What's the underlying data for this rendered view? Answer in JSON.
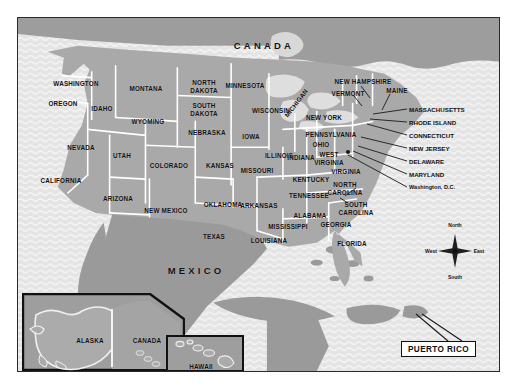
{
  "figure": {
    "kind": "reference-map",
    "title_visible": false,
    "frame": {
      "border_color": "#2b2b2b"
    }
  },
  "palette": {
    "land_us": "#a9a9a9",
    "land_foreign": "#9a9a9a",
    "ocean": "#e4e4e4",
    "ocean_wave": "#f4f4f4",
    "border_state": "#ffffff",
    "border_frame": "#2b2b2b",
    "label_text": "#111111",
    "tag_background": "#ffffff"
  },
  "countries": [
    {
      "name": "CANADA",
      "x": 246,
      "y": 27
    },
    {
      "name": "MEXICO",
      "x": 178,
      "y": 252
    }
  ],
  "states": [
    {
      "name": "WASHINGTON",
      "x": 58,
      "y": 65
    },
    {
      "name": "OREGON",
      "x": 45,
      "y": 85
    },
    {
      "name": "IDAHO",
      "x": 84,
      "y": 90
    },
    {
      "name": "MONTANA",
      "x": 128,
      "y": 70
    },
    {
      "name": "WYOMING",
      "x": 130,
      "y": 103
    },
    {
      "name": "NORTH DAKOTA",
      "x": 186,
      "y": 68,
      "lines": [
        "NORTH",
        "DAKOTA"
      ]
    },
    {
      "name": "SOUTH DAKOTA",
      "x": 186,
      "y": 91,
      "lines": [
        "SOUTH",
        "DAKOTA"
      ]
    },
    {
      "name": "NEBRASKA",
      "x": 189,
      "y": 114
    },
    {
      "name": "NEVADA",
      "x": 63,
      "y": 129
    },
    {
      "name": "UTAH",
      "x": 104,
      "y": 137
    },
    {
      "name": "COLORADO",
      "x": 151,
      "y": 147
    },
    {
      "name": "KANSAS",
      "x": 202,
      "y": 147
    },
    {
      "name": "CALIFORNIA",
      "x": 43,
      "y": 162
    },
    {
      "name": "ARIZONA",
      "x": 100,
      "y": 180
    },
    {
      "name": "NEW MEXICO",
      "x": 148,
      "y": 192
    },
    {
      "name": "TEXAS",
      "x": 196,
      "y": 218
    },
    {
      "name": "OKLAHOMA",
      "x": 205,
      "y": 186
    },
    {
      "name": "MINNESOTA",
      "x": 227,
      "y": 67
    },
    {
      "name": "IOWA",
      "x": 233,
      "y": 118
    },
    {
      "name": "WISCONSIN",
      "x": 253,
      "y": 92
    },
    {
      "name": "MISSOURI",
      "x": 239,
      "y": 152
    },
    {
      "name": "ARKANSAS",
      "x": 241,
      "y": 187
    },
    {
      "name": "LOUISIANA",
      "x": 251,
      "y": 222
    },
    {
      "name": "MISSISSIPPI",
      "x": 270,
      "y": 208
    },
    {
      "name": "ALABAMA",
      "x": 292,
      "y": 197
    },
    {
      "name": "TENNESSEE",
      "x": 291,
      "y": 177
    },
    {
      "name": "KENTUCKY",
      "x": 293,
      "y": 161
    },
    {
      "name": "ILLINOIS",
      "x": 261,
      "y": 137
    },
    {
      "name": "INDIANA",
      "x": 283,
      "y": 139
    },
    {
      "name": "OHIO",
      "x": 303,
      "y": 126
    },
    {
      "name": "MICHIGAN",
      "x": 278,
      "y": 85,
      "rotated": true
    },
    {
      "name": "GEORGIA",
      "x": 318,
      "y": 206
    },
    {
      "name": "FLORIDA",
      "x": 334,
      "y": 225
    },
    {
      "name": "SOUTH CAROLINA",
      "x": 338,
      "y": 190,
      "lines": [
        "SOUTH",
        "CAROLINA"
      ]
    },
    {
      "name": "NORTH CAROLINA",
      "x": 327,
      "y": 170,
      "lines": [
        "NORTH",
        "CAROLINA"
      ]
    },
    {
      "name": "VIRGINIA",
      "x": 328,
      "y": 153
    },
    {
      "name": "WEST VIRGINIA",
      "x": 311,
      "y": 140,
      "lines": [
        "WEST",
        "VIRGINIA"
      ]
    },
    {
      "name": "PENNSYLVANIA",
      "x": 313,
      "y": 116
    },
    {
      "name": "NEW YORK",
      "x": 306,
      "y": 99
    },
    {
      "name": "VERMONT",
      "x": 330,
      "y": 75
    },
    {
      "name": "NEW HAMPSHIRE",
      "x": 345,
      "y": 63
    },
    {
      "name": "MAINE",
      "x": 379,
      "y": 72
    }
  ],
  "callouts": [
    {
      "name": "MASSACHUSETTS",
      "x": 392,
      "y": 91,
      "anchor_x": 355,
      "anchor_y": 96
    },
    {
      "name": "RHODE ISLAND",
      "x": 392,
      "y": 104,
      "anchor_x": 352,
      "anchor_y": 101
    },
    {
      "name": "CONNECTICUT",
      "x": 392,
      "y": 117,
      "anchor_x": 349,
      "anchor_y": 105
    },
    {
      "name": "NEW JERSEY",
      "x": 392,
      "y": 130,
      "anchor_x": 343,
      "anchor_y": 118
    },
    {
      "name": "DELAWARE",
      "x": 392,
      "y": 143,
      "anchor_x": 340,
      "anchor_y": 128
    },
    {
      "name": "MARYLAND",
      "x": 392,
      "y": 156,
      "anchor_x": 335,
      "anchor_y": 133
    },
    {
      "name": "Washington, D.C.",
      "x": 392,
      "y": 169,
      "anchor_x": 330,
      "anchor_y": 136,
      "mixed_case": true
    }
  ],
  "compass": {
    "north": "North",
    "south": "South",
    "east": "East",
    "west": "West"
  },
  "tags": [
    {
      "name": "PUERTO RICO"
    }
  ],
  "insets": [
    {
      "id": "alaska",
      "labels": [
        {
          "text": "ALASKA",
          "x": 89,
          "y": 322
        },
        {
          "text": "CANADA",
          "x": 146,
          "y": 322
        }
      ]
    },
    {
      "id": "hawaii",
      "labels": [
        {
          "text": "HAWAII",
          "x": 183,
          "y": 353
        }
      ]
    }
  ]
}
